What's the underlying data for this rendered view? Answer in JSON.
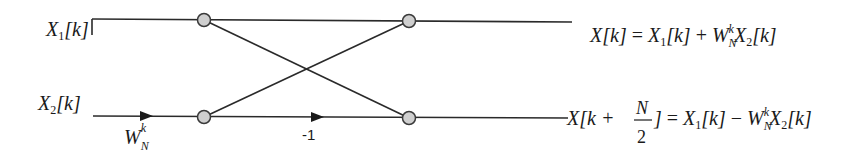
{
  "diagram": {
    "type": "fft-butterfly",
    "colors": {
      "line": "#2a2a2a",
      "node_fill": "#cfcfcf",
      "node_stroke": "#3a3a3a",
      "text": "#1a1a1a"
    },
    "inputs": [
      {
        "id": "x1",
        "base": "X",
        "sub": "1",
        "arg": "[k]"
      },
      {
        "id": "x2",
        "base": "X",
        "sub": "2",
        "arg": "[k]"
      }
    ],
    "branch_labels": {
      "twiddle": {
        "base": "W",
        "sub": "N",
        "sup": "k"
      },
      "negate": "-1"
    },
    "nodes": [
      {
        "id": "n1",
        "cx": 204,
        "cy": 20
      },
      {
        "id": "n2",
        "cx": 204,
        "cy": 117
      },
      {
        "id": "n3",
        "cx": 409,
        "cy": 21
      },
      {
        "id": "n4",
        "cx": 409,
        "cy": 118
      }
    ],
    "outputs": {
      "top": {
        "lhs": "X[k]",
        "eq": "=",
        "rhs_a": "X",
        "rhs_a_sub": "1",
        "rhs_a_arg": "[k]",
        "op": "+",
        "w": "W",
        "w_sub": "N",
        "w_sup": "k",
        "rhs_b": "X",
        "rhs_b_sub": "2",
        "rhs_b_arg": "[k]"
      },
      "bottom": {
        "lhs_pre": "X[k +",
        "frac_num": "N",
        "frac_den": "2",
        "lhs_post": "]",
        "eq": "=",
        "rhs_a": "X",
        "rhs_a_sub": "1",
        "rhs_a_arg": "[k]",
        "op": "−",
        "w": "W",
        "w_sub": "N",
        "w_sup": "k",
        "rhs_b": "X",
        "rhs_b_sub": "2",
        "rhs_b_arg": "[k]"
      }
    }
  }
}
